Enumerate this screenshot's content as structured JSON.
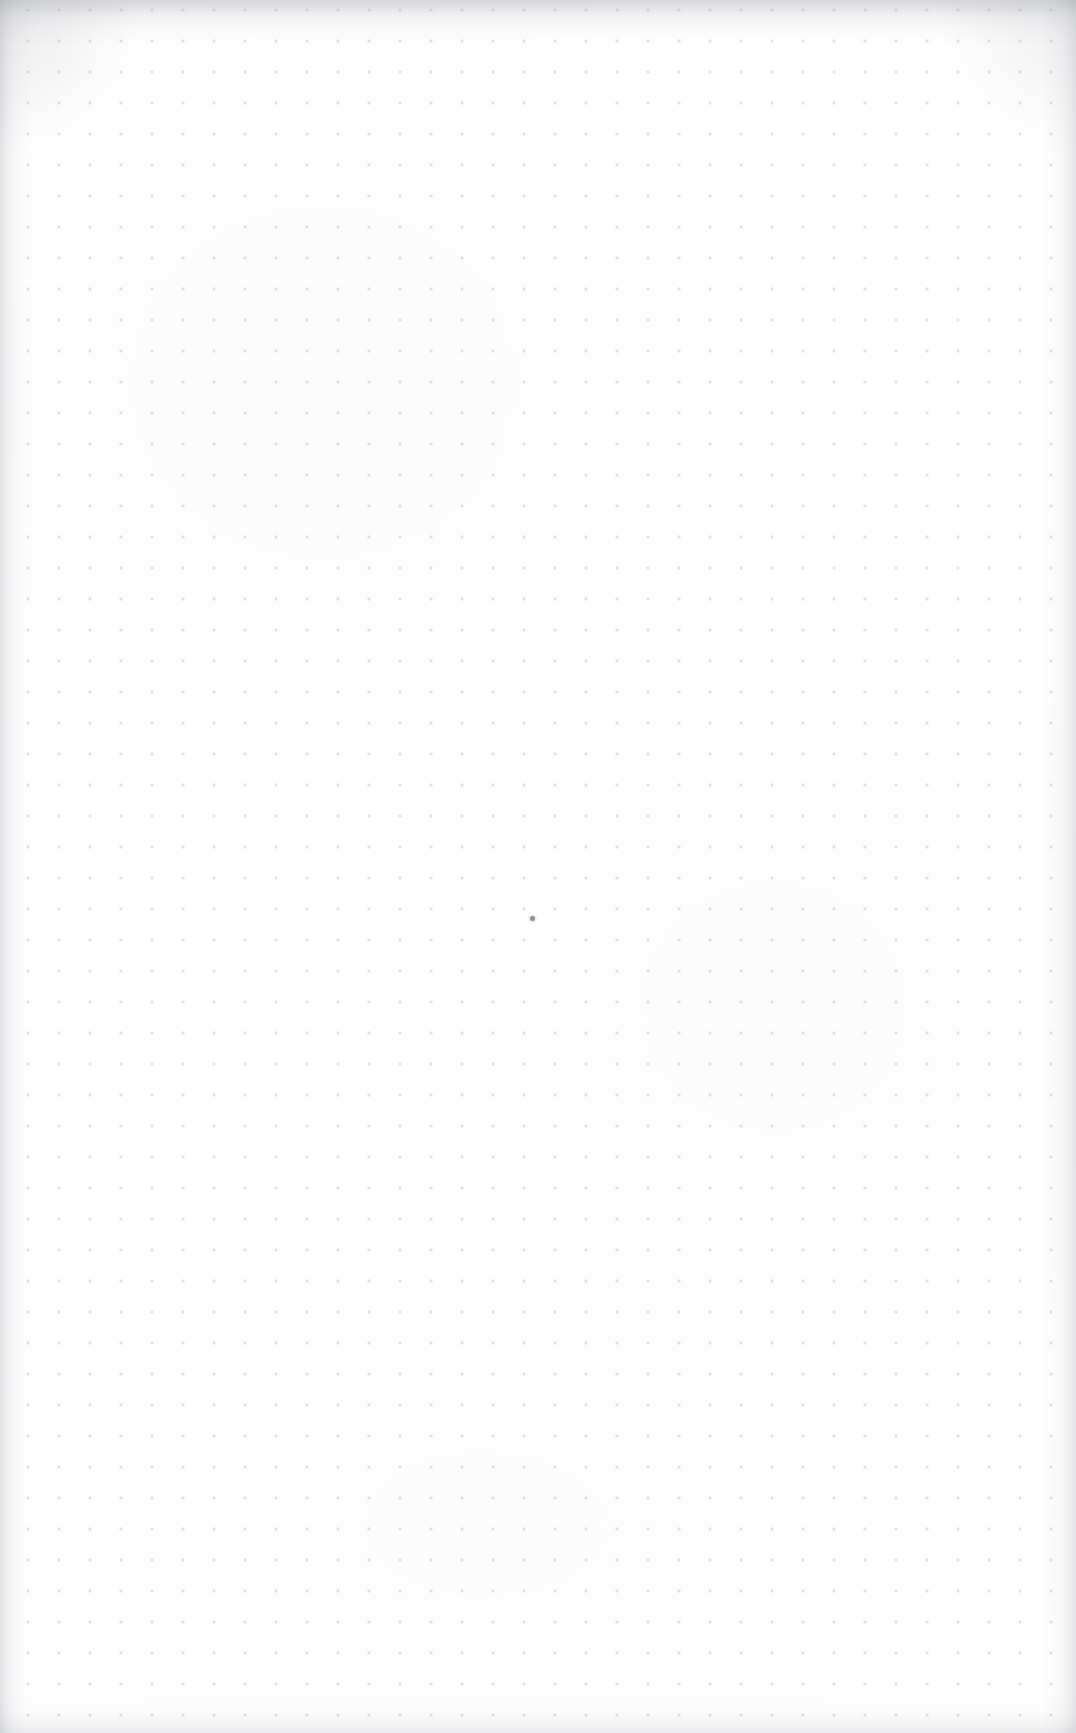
{
  "page": {
    "kind": "blank-dot-grid-notebook-page",
    "width_px": 1076,
    "height_px": 1733,
    "background_color": "#ffffff",
    "visible_text": "",
    "caption": ""
  },
  "grid": {
    "name": "dot-grid",
    "dot_color": "#787c86",
    "dot_opacity": 0.3,
    "dot_diameter_px": 2,
    "spacing_px": 31,
    "origin_x_px": 90,
    "origin_y_px": 72,
    "columns": 29,
    "rows": 50,
    "last_dot_x_px": 965,
    "last_dot_y_px": 1610
  },
  "marks": [
    {
      "name": "ink-dot",
      "description": "single small darker pen dot",
      "x_px": 532,
      "y_px": 918,
      "diameter_px": 5,
      "color": "#60636c"
    }
  ],
  "edges": {
    "top_band": {
      "name": "scan-edge-top",
      "color": "#969ba0",
      "height_px": 46
    },
    "left_band": {
      "name": "scan-edge-left",
      "color": "#969ba0",
      "width_px": 34
    },
    "right_band": {
      "name": "scan-edge-right",
      "color": "#969ba0",
      "width_px": 34
    },
    "bottom_band": {
      "name": "scan-edge-bottom",
      "color": "#a0a3aa",
      "height_px": 40
    }
  }
}
